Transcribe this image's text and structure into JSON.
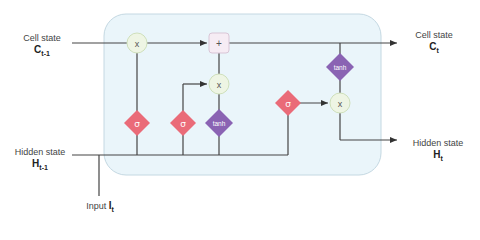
{
  "colors": {
    "cell_fill": "#eaf5fa",
    "cell_border": "#c4d8e2",
    "line": "#444444",
    "sigma_gate": "#ea6b78",
    "tanh_gate": "#8a63b3",
    "multiply_fill": "#eef5e4",
    "multiply_border": "#cfe0bb",
    "add_fill": "#f6ecf4",
    "add_border": "#d9c5d6"
  },
  "labels": {
    "cell_in": {
      "text": "Cell state",
      "symbol": "C",
      "subscript": "t-1"
    },
    "cell_out": {
      "text": "Cell state",
      "symbol": "C",
      "subscript": "t"
    },
    "hidden_in": {
      "text": "Hidden state",
      "symbol": "H",
      "subscript": "t-1"
    },
    "hidden_out": {
      "text": "Hidden state",
      "symbol": "H",
      "subscript": "t"
    },
    "input": {
      "text": "Input",
      "symbol": "I",
      "subscript": "t"
    }
  },
  "nodes": {
    "forget_multiply": "x",
    "add": "+",
    "input_multiply": "x",
    "output_multiply": "x",
    "forget_gate": "σ",
    "input_gate": "σ",
    "candidate": "tanh",
    "output_gate": "σ",
    "output_tanh": "tanh"
  }
}
